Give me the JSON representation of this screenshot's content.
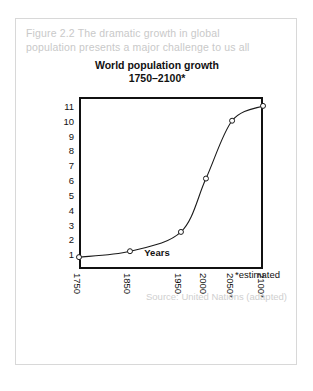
{
  "figure": {
    "caption_line1": "Figure 2.2 The dramatic growth in global",
    "caption_line2": "population presents a major challenge to us all",
    "caption_color": "#c9c9c9",
    "source_note": "Source: United Nations (adapted)",
    "estimated_note": "*estimated",
    "border_color": "#d8d8d8"
  },
  "chart_data": {
    "type": "line",
    "title": "World population growth",
    "subtitle": "1750–2100*",
    "xlabel": "Years",
    "ylabel": "Billions of people",
    "x": [
      1750,
      1850,
      1950,
      2000,
      2050,
      2100
    ],
    "categories": [
      "1750",
      "1850",
      "1950",
      "2000",
      "2050*",
      "2100*"
    ],
    "values": [
      0.8,
      1.2,
      2.5,
      6.1,
      10.0,
      11.0
    ],
    "series": [
      {
        "name": "World population",
        "values": [
          0.8,
          1.2,
          2.5,
          6.1,
          10.0,
          11.0
        ]
      }
    ],
    "ylim": [
      0,
      11.6
    ],
    "yticks": [
      11,
      10,
      9,
      8,
      7,
      6,
      5,
      4,
      3,
      2,
      1
    ],
    "ytick_labels": [
      "11",
      "10",
      "9",
      "8",
      "7",
      "6",
      "5",
      "4",
      "3",
      "2",
      "1"
    ],
    "xtick_positions_pct": [
      0,
      27.7,
      55.4,
      69.0,
      83.2,
      100
    ],
    "grid": false,
    "legend": false,
    "line_color": "#1a1a1a",
    "marker": "open-circle",
    "marker_fill": "#ffffff"
  }
}
